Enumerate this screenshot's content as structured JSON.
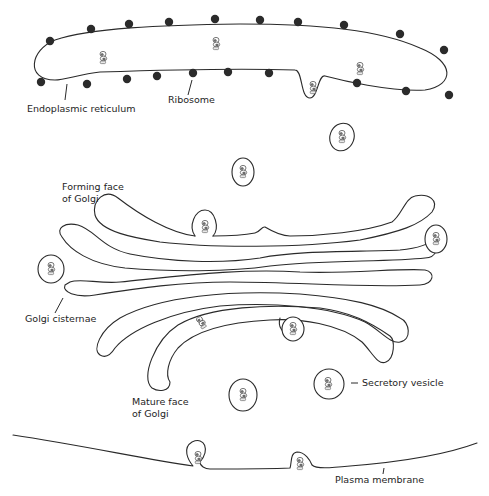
{
  "diagram": {
    "colors": {
      "line": "#2a2a2a",
      "ribosome": "#2b2b2b",
      "background": "#ffffff",
      "text": "#1e1e1e"
    },
    "labels": {
      "er": "Endoplasmic reticulum",
      "ribosome": "Ribosome",
      "forming_face_line1": "Forming face",
      "forming_face_line2": "of Golgi",
      "cisternae": "Golgi cisternae",
      "mature_face_line1": "Mature face",
      "mature_face_line2": "of Golgi",
      "secretory_vesicle": "Secretory vesicle",
      "plasma_membrane": "Plasma membrane"
    },
    "components": {
      "ribosome_count": 24,
      "golgi_cisternae_count": 6,
      "free_vesicles": 6,
      "protein_icon": "protein-glyph"
    }
  }
}
